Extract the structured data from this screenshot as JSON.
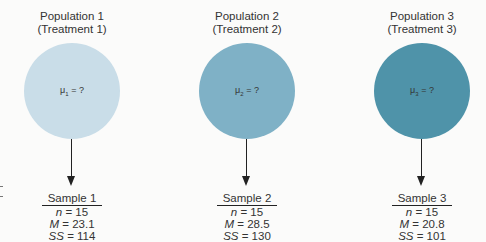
{
  "populations": [
    {
      "title_line1": "Population 1",
      "title_line2": "(Treatment 1)",
      "mu_symbol": "μ",
      "mu_sub": "1",
      "mu_rest": " = ?",
      "color": "#c9dde8",
      "sample": {
        "name": "Sample 1",
        "n_label": "n",
        "n_value": " = 15",
        "m_label": "M",
        "m_value": " = 23.1",
        "ss_label": "SS",
        "ss_value": " = 114"
      }
    },
    {
      "title_line1": "Population 2",
      "title_line2": "(Treatment 2)",
      "mu_symbol": "μ",
      "mu_sub": "2",
      "mu_rest": " = ?",
      "color": "#7fb1c6",
      "sample": {
        "name": "Sample 2",
        "n_label": "n",
        "n_value": " = 15",
        "m_label": "M",
        "m_value": " = 28.5",
        "ss_label": "SS",
        "ss_value": " = 130"
      }
    },
    {
      "title_line1": "Population 3",
      "title_line2": "(Treatment 3)",
      "mu_symbol": "μ",
      "mu_sub": "3",
      "mu_rest": " = ?",
      "color": "#4f93a9",
      "sample": {
        "name": "Sample 3",
        "n_label": "n",
        "n_value": " = 15",
        "m_label": "M",
        "m_value": " = 20.8",
        "ss_label": "SS",
        "ss_value": " = 101"
      }
    }
  ]
}
